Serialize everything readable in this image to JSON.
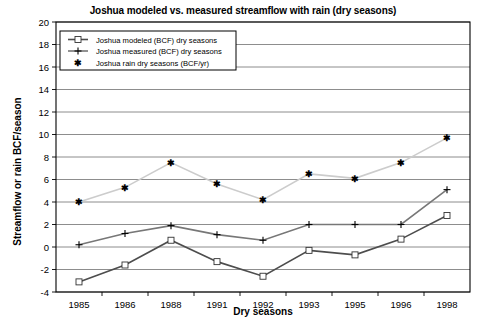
{
  "chart_data": {
    "type": "line",
    "title": "Joshua modeled vs. measured streamflow with rain (dry seasons)",
    "xlabel": "Dry seasons",
    "ylabel": "Streamflow or rain BCF/season",
    "categories": [
      "1985",
      "1986",
      "1988",
      "1991",
      "1992",
      "1993",
      "1995",
      "1996",
      "1998"
    ],
    "ylim": [
      -4,
      20
    ],
    "ytick_step": 2,
    "yticks": [
      "20",
      "18",
      "16",
      "14",
      "12",
      "10",
      "8",
      "6",
      "4",
      "2",
      "0",
      "-2",
      "-4"
    ],
    "grid": true,
    "legend_position": "top-left-inside",
    "series": [
      {
        "name": "Joshua modeled (BCF) dry seasons",
        "marker": "square",
        "color": "#4d4d4d",
        "values": [
          -3.1,
          -1.6,
          0.6,
          -1.3,
          -2.6,
          -0.3,
          -0.7,
          0.7,
          2.8
        ]
      },
      {
        "name": "Joshua measured (BCF) dry seasons",
        "marker": "plus",
        "color": "#777777",
        "values": [
          0.2,
          1.2,
          1.9,
          1.1,
          0.6,
          2.0,
          2.0,
          2.0,
          5.1
        ]
      },
      {
        "name": "Joshua rain dry seasons (BCF/yr)",
        "marker": "asterisk",
        "color": "#cccccc",
        "values": [
          4.0,
          5.3,
          7.5,
          5.6,
          4.2,
          6.5,
          6.1,
          7.5,
          9.7
        ]
      }
    ]
  },
  "colors": {
    "axis": "#000000",
    "gridline": "#808080",
    "plot_background": "#ffffff",
    "legend_border": "#000000"
  }
}
